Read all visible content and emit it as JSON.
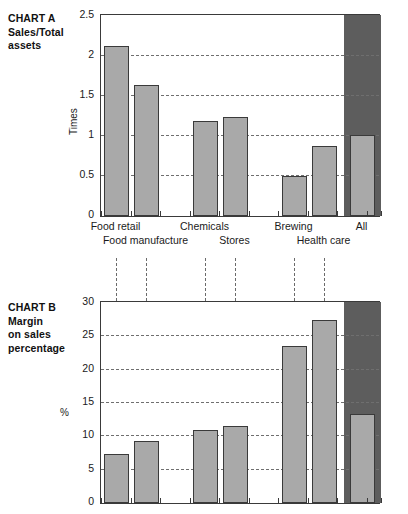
{
  "figure": {
    "background": "#ffffff",
    "bar_fill": "#a9a9a9",
    "bar_stroke": "#3a3a3a",
    "band_fill": "#5d5d5d",
    "grid_color": "#6f6f6f"
  },
  "chart_data": [
    {
      "id": "chart-a",
      "type": "bar",
      "title": "CHART A\nSales/Total\nassets",
      "title_lines": [
        "CHART A",
        "Sales/Total",
        "assets"
      ],
      "ylabel": "Times",
      "xlabel": "",
      "ylim": [
        0,
        2.5
      ],
      "yticks": [
        0,
        0.5,
        1,
        1.5,
        2,
        2.5
      ],
      "ytick_labels": [
        "0",
        "0.5",
        "1",
        "1.5",
        "2",
        "2.5"
      ],
      "grid": true,
      "gridlines_at": [
        0.5,
        1,
        1.5,
        2
      ],
      "legend": "none",
      "categories": [
        "Food retail",
        "Food manufacture",
        "Chemicals",
        "Stores",
        "Brewing",
        "Health care",
        "All"
      ],
      "values": [
        2.13,
        1.64,
        1.19,
        1.24,
        0.5,
        0.87,
        1.01
      ],
      "highlight_category": "All",
      "bars": [
        {
          "label": "Food retail",
          "value": 2.13,
          "row": "top"
        },
        {
          "label": "Food manufacture",
          "value": 1.64,
          "row": "bottom"
        },
        {
          "label": "Chemicals",
          "value": 1.19,
          "row": "top"
        },
        {
          "label": "Stores",
          "value": 1.24,
          "row": "bottom"
        },
        {
          "label": "Brewing",
          "value": 0.5,
          "row": "top"
        },
        {
          "label": "Health care",
          "value": 0.87,
          "row": "bottom"
        },
        {
          "label": "All",
          "value": 1.01,
          "row": "top"
        }
      ]
    },
    {
      "id": "chart-b",
      "type": "bar",
      "title": "CHART B\nMargin\non sales\npercentage",
      "title_lines": [
        "CHART B",
        "Margin",
        "on sales",
        "percentage"
      ],
      "ylabel": "%",
      "xlabel": "",
      "ylim": [
        0,
        30
      ],
      "yticks": [
        0,
        5,
        10,
        15,
        20,
        25,
        30
      ],
      "ytick_labels": [
        "0",
        "5",
        "10",
        "15",
        "20",
        "25",
        "30"
      ],
      "grid": true,
      "gridlines_at": [
        5,
        10,
        15,
        20,
        25
      ],
      "legend": "none",
      "categories": [
        "Food retail",
        "Food manufacture",
        "Chemicals",
        "Stores",
        "Brewing",
        "Health care",
        "All"
      ],
      "values": [
        7.3,
        9.3,
        10.9,
        11.5,
        23.5,
        27.5,
        13.3
      ],
      "highlight_category": "All",
      "bars": [
        {
          "label": "Food retail",
          "value": 7.3
        },
        {
          "label": "Food manufacture",
          "value": 9.3
        },
        {
          "label": "Chemicals",
          "value": 10.9
        },
        {
          "label": "Stores",
          "value": 11.5
        },
        {
          "label": "Brewing",
          "value": 23.5
        },
        {
          "label": "Health care",
          "value": 27.5
        },
        {
          "label": "All",
          "value": 13.3
        }
      ]
    }
  ],
  "connectors": {
    "count": 6,
    "style": "dashed-vertical",
    "note": "vertical dashed guides linking the six named sector bars of chart A to chart B"
  }
}
